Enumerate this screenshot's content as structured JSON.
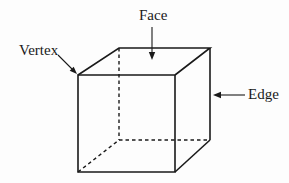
{
  "diagram": {
    "type": "labeled-cube",
    "labels": {
      "face": "Face",
      "vertex": "Vertex",
      "edge": "Edge"
    },
    "annotations": [
      {
        "label": "Face",
        "target": "top-face",
        "arrow_direction": "down"
      },
      {
        "label": "Vertex",
        "target": "front-top-left-corner",
        "arrow_direction": "down-right"
      },
      {
        "label": "Edge",
        "target": "back-right-edge",
        "arrow_direction": "left"
      }
    ],
    "colors": {
      "line": "#1a1a1a",
      "background": "#fdfdfd",
      "text": "#1a1a1a"
    }
  }
}
